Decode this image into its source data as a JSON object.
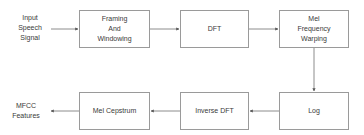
{
  "diagram": {
    "input_label": "Input\nSpeech\nSignal",
    "output_label": "MFCC\nFeatures",
    "nodes": [
      {
        "id": "framing",
        "label": "Framing\nAnd\nWindowing"
      },
      {
        "id": "dft",
        "label": "DFT"
      },
      {
        "id": "mel",
        "label": "Mel\nFrequency\nWarping"
      },
      {
        "id": "log",
        "label": "Log"
      },
      {
        "id": "idft",
        "label": "Inverse DFT"
      },
      {
        "id": "cepstrum",
        "label": "Mel Cepstrum"
      }
    ],
    "edges": [
      {
        "from": "input",
        "to": "framing"
      },
      {
        "from": "framing",
        "to": "dft"
      },
      {
        "from": "dft",
        "to": "mel"
      },
      {
        "from": "mel",
        "to": "log"
      },
      {
        "from": "log",
        "to": "idft"
      },
      {
        "from": "idft",
        "to": "cepstrum"
      },
      {
        "from": "cepstrum",
        "to": "output"
      }
    ],
    "colors": {
      "line": "#6e6e6e",
      "border": "#9a9a9a",
      "text": "#3a3a3a"
    }
  }
}
